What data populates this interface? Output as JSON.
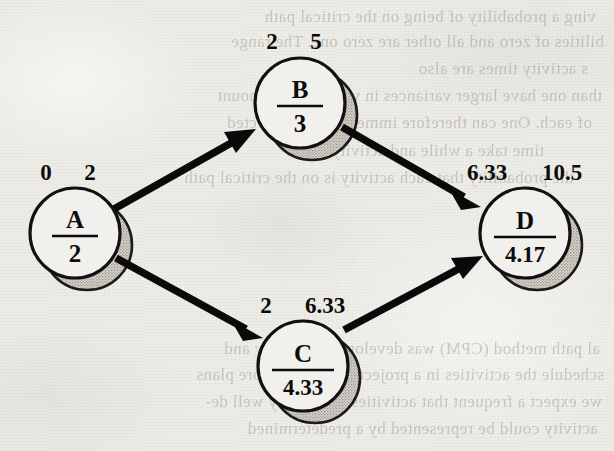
{
  "figure": {
    "kind": "project-network-diagram",
    "notation": "activity-on-node",
    "paper": {
      "background_color": "#eeece7",
      "ink_color": "#0b0b0b",
      "shadow_color": "#b9b5ad"
    }
  },
  "nodes": [
    {
      "id": "A",
      "letter": "A",
      "duration": "2",
      "early_time": "0",
      "late_time": "2",
      "cx": 75,
      "cy": 233,
      "r": 45
    },
    {
      "id": "B",
      "letter": "B",
      "duration": "3",
      "early_time": "2",
      "late_time": "5",
      "cx": 300,
      "cy": 103,
      "r": 45
    },
    {
      "id": "C",
      "letter": "C",
      "duration": "4.33",
      "early_time": "2",
      "late_time": "6.33",
      "cx": 303,
      "cy": 366,
      "r": 45
    },
    {
      "id": "D",
      "letter": "D",
      "duration": "4.17",
      "early_time": "6.33",
      "late_time": "10.5",
      "cx": 525,
      "cy": 233,
      "r": 45
    }
  ],
  "edges": [
    {
      "id": "A-B",
      "from": "A",
      "to": "B",
      "label": ""
    },
    {
      "id": "A-C",
      "from": "A",
      "to": "C",
      "label": ""
    },
    {
      "id": "B-D",
      "from": "B",
      "to": "D",
      "label": ""
    },
    {
      "id": "C-D",
      "from": "C",
      "to": "D",
      "label": ""
    }
  ],
  "bleed_through_lines": [
    {
      "text": "ving a probability of being on the critical path",
      "x": 18,
      "y": 4
    },
    {
      "text": "bilities of zero and all other are zero one. The range",
      "x": 10,
      "y": 29
    },
    {
      "text": "s activity times are also",
      "x": 26,
      "y": 56
    },
    {
      "text": "than one have larger variances in value of the amount",
      "x": 12,
      "y": 83
    },
    {
      "text": "of each. One can therefore immediate the expected",
      "x": 22,
      "y": 110
    },
    {
      "text": "time take a while and activity in the",
      "x": 70,
      "y": 138
    },
    {
      "text": "the probability that each activity is on the critical path",
      "x": 40,
      "y": 165
    },
    {
      "text": "al path method (CPM) was developed by Kelley and",
      "x": 14,
      "y": 336
    },
    {
      "text": "schedule the activities in a project without or more plans",
      "x": 10,
      "y": 362
    },
    {
      "text": "we expect a frequent that activities were fairly well de-",
      "x": 12,
      "y": 389
    },
    {
      "text": "activity could be represented by a predetermined",
      "x": 16,
      "y": 416
    }
  ]
}
